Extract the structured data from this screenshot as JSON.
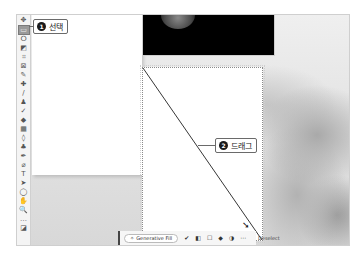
{
  "toolbar": {
    "tools": [
      {
        "name": "move-tool",
        "glyph": "✥"
      },
      {
        "name": "rectangular-marquee-tool",
        "glyph": "▭",
        "active": true
      },
      {
        "name": "lasso-tool",
        "glyph": "ⵔ"
      },
      {
        "name": "object-selection-tool",
        "glyph": "◩"
      },
      {
        "name": "crop-tool",
        "glyph": "⌗"
      },
      {
        "name": "frame-tool",
        "glyph": "⊠"
      },
      {
        "name": "eyedropper-tool",
        "glyph": "✎"
      },
      {
        "name": "spot-healing-brush-tool",
        "glyph": "✚"
      },
      {
        "name": "brush-tool",
        "glyph": "∕"
      },
      {
        "name": "clone-stamp-tool",
        "glyph": "♟"
      },
      {
        "name": "history-brush-tool",
        "glyph": "✓"
      },
      {
        "name": "eraser-tool",
        "glyph": "◆"
      },
      {
        "name": "gradient-tool",
        "glyph": "▦"
      },
      {
        "name": "blur-tool",
        "glyph": "◊"
      },
      {
        "name": "dodge-tool",
        "glyph": "♣"
      },
      {
        "name": "pen-tool",
        "glyph": "✒"
      },
      {
        "name": "freeform-pen-tool",
        "glyph": "⌀"
      },
      {
        "name": "type-tool",
        "glyph": "T"
      },
      {
        "name": "path-selection-tool",
        "glyph": "➤"
      },
      {
        "name": "ellipse-tool",
        "glyph": "◯"
      },
      {
        "name": "hand-tool",
        "glyph": "✋"
      },
      {
        "name": "zoom-tool",
        "glyph": "🔍"
      },
      {
        "name": "more-tools",
        "glyph": "…"
      },
      {
        "name": "foreground-background-colors",
        "glyph": "◪"
      }
    ]
  },
  "callouts": {
    "step1": {
      "number": "1",
      "label": "선택"
    },
    "step2": {
      "number": "2",
      "label": "드래그"
    }
  },
  "taskbar": {
    "generative_fill_label": "Generative Fill",
    "deselect_label": "Deselect",
    "icons": [
      "modify-selection-icon",
      "mask-icon",
      "invert-selection-icon",
      "fill-icon",
      "adjustment-icon",
      "more-icon"
    ]
  },
  "colors": {
    "callout_badge": "#1a1a1a",
    "selection_border": "#8a8a8a",
    "toolbar_bg": "#f4f4f4"
  }
}
